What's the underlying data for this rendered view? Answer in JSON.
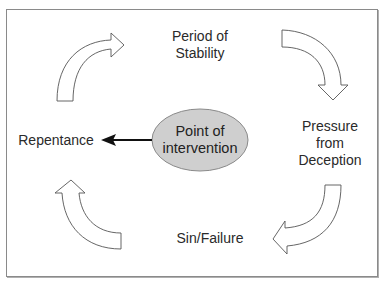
{
  "diagram": {
    "type": "cycle",
    "nodes": {
      "top": "Period of\nStability",
      "top_line1": "Period of",
      "top_line2": "Stability",
      "right_line1": "Pressure",
      "right_line2": "from",
      "right_line3": "Deception",
      "bottom": "Sin/Failure",
      "left": "Repentance"
    },
    "center": {
      "line1": "Point of",
      "line2": "intervention",
      "fill": "#cfcfcf",
      "stroke": "#8a8a8a"
    },
    "center_arrow": {
      "from": "Point of intervention",
      "to": "Repentance",
      "color": "#111111"
    },
    "cycle_arrows": [
      {
        "id": "left-to-top",
        "direction": "clockwise",
        "style": "hollow-curved"
      },
      {
        "id": "top-to-right",
        "direction": "clockwise",
        "style": "hollow-curved"
      },
      {
        "id": "right-to-bottom",
        "direction": "clockwise",
        "style": "hollow-curved"
      },
      {
        "id": "bottom-to-left",
        "direction": "clockwise",
        "style": "hollow-curved"
      }
    ],
    "colors": {
      "arrow_stroke": "#555555",
      "border": "#8a8a8a",
      "text": "#2a2a2a"
    }
  }
}
